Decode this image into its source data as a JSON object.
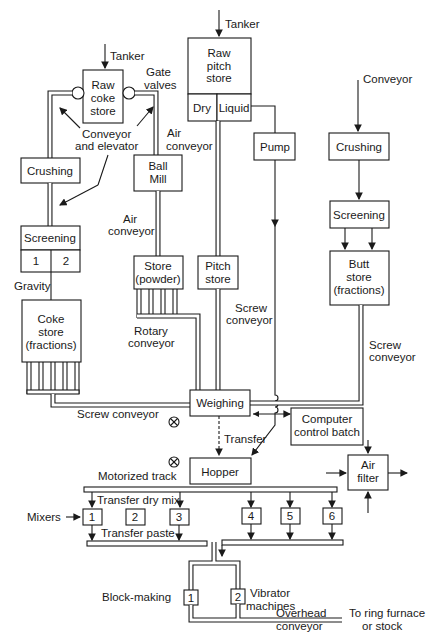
{
  "diagram": {
    "type": "process-flow",
    "labels": {
      "tanker_left": "Tanker",
      "tanker_pitch": "Tanker",
      "gate_valves_1": "Gate",
      "gate_valves_2": "valves",
      "conv_elev_1": "Conveyor",
      "conv_elev_2": "and elevator",
      "air_conv_top_1": "Air",
      "air_conv_top_2": "conveyor",
      "air_conv_mid_1": "Air",
      "air_conv_mid_2": "conveyor",
      "gravity": "Gravity",
      "rotary_1": "Rotary",
      "rotary_2": "conveyor",
      "screw_mid_1": "Screw",
      "screw_mid_2": "conveyor",
      "screw_right_1": "Screw",
      "screw_right_2": "conveyor",
      "screw_bottom": "Screw conveyor",
      "conveyor_right": "Conveyor",
      "transfer": "Transfer",
      "motorized_track": "Motorized track",
      "transfer_dry_mix": "Transfer dry mix",
      "mixers": "Mixers",
      "transfer_paste": "Transfer paste",
      "block_making": "Block-making",
      "vibrator_1": "Vibrator",
      "vibrator_2": "machines",
      "overhead_1": "Overhead",
      "overhead_2": "conveyor",
      "ring_1": "To ring furnace",
      "ring_2": "or stock"
    },
    "boxes": {
      "raw_coke": [
        "Raw",
        "coke",
        "store"
      ],
      "raw_pitch": [
        "Raw",
        "pitch",
        "store"
      ],
      "dry": "Dry",
      "liquid": "Liquid",
      "crushing_left": "Crushing",
      "ball_mill": [
        "Ball",
        "Mill"
      ],
      "pump": "Pump",
      "crushing_right": "Crushing",
      "screening_left": "Screening",
      "screen_1": "1",
      "screen_2": "2",
      "store_powder": [
        "Store",
        "(powder)"
      ],
      "pitch_store": [
        "Pitch",
        "store"
      ],
      "screening_right": "Screening",
      "butt_store": [
        "Butt",
        "store",
        "(fractions)"
      ],
      "coke_store": [
        "Coke",
        "store",
        "(fractions)"
      ],
      "weighing": "Weighing",
      "computer": [
        "Computer",
        "control batch"
      ],
      "hopper": "Hopper",
      "air_filter": [
        "Air",
        "filter"
      ],
      "mixers": [
        "1",
        "2",
        "3",
        "4",
        "5",
        "6"
      ],
      "vibrators": [
        "1",
        "2"
      ]
    }
  }
}
